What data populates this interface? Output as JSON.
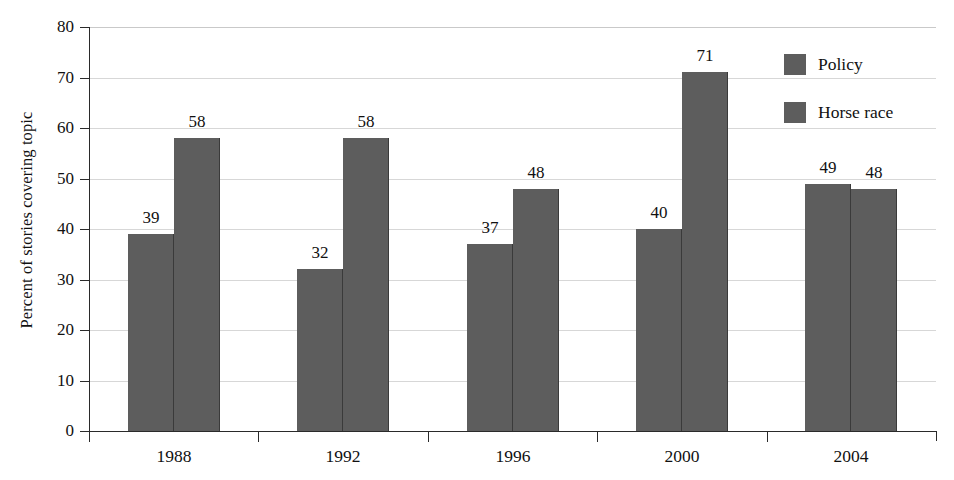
{
  "chart_data": {
    "type": "bar",
    "title": "",
    "xlabel": "",
    "ylabel": "Percent of stories covering topic",
    "categories": [
      "1988",
      "1992",
      "1996",
      "2000",
      "2004"
    ],
    "series": [
      {
        "name": "Policy",
        "values": [
          39,
          32,
          37,
          40,
          49
        ],
        "color": "#5d5d5d"
      },
      {
        "name": "Horse race",
        "values": [
          58,
          58,
          48,
          71,
          48
        ],
        "color": "#5d5d5d"
      }
    ],
    "ylim": [
      0,
      80
    ],
    "yticks": [
      0,
      10,
      20,
      30,
      40,
      50,
      60,
      70,
      80
    ],
    "ytick_labels": [
      "0",
      "10",
      "20",
      "30",
      "40",
      "50",
      "60",
      "70",
      "80"
    ],
    "grid": true,
    "grid_axis": "y",
    "legend_position": "top-right",
    "data_labels": true
  },
  "legend": {
    "items": [
      {
        "label": "Policy",
        "swatch": "#5d5d5d"
      },
      {
        "label": "Horse race",
        "swatch": "#5d5d5d"
      }
    ]
  },
  "colors": {
    "bar": "#5d5d5d",
    "bar_edge": "#3a3a3a",
    "grid": "#d7d7d7",
    "axis": "#2a2a2a",
    "text": "#111111",
    "background": "#ffffff"
  }
}
